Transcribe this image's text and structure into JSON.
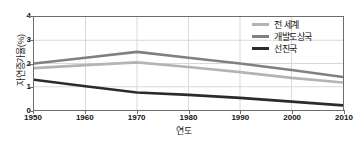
{
  "chart_data": {
    "type": "line",
    "title": "",
    "xlabel": "연도",
    "ylabel": "자연증가율(%)",
    "x": [
      1950,
      1960,
      1970,
      1980,
      1990,
      2000,
      2010
    ],
    "xlim": [
      1950,
      2010
    ],
    "ylim": [
      0,
      4
    ],
    "yticks": [
      0,
      1,
      2,
      3,
      4
    ],
    "xticks": [
      1950,
      1960,
      1970,
      1980,
      1990,
      2000,
      2010
    ],
    "grid": true,
    "legend_position": "top-right",
    "series": [
      {
        "name": "전 세계",
        "color": "#b4b4b4",
        "values": [
          1.8,
          1.93,
          2.05,
          1.85,
          1.63,
          1.38,
          1.18
        ]
      },
      {
        "name": "개발도상국",
        "color": "#808080",
        "values": [
          2.0,
          2.25,
          2.5,
          2.25,
          2.0,
          1.72,
          1.42
        ]
      },
      {
        "name": "선진국",
        "color": "#2b2b2b",
        "values": [
          1.3,
          1.02,
          0.75,
          0.65,
          0.52,
          0.36,
          0.2
        ]
      }
    ]
  },
  "axes": {
    "y_tick_labels": [
      "0",
      "1",
      "2",
      "3",
      "4"
    ],
    "x_tick_labels": [
      "1950",
      "1960",
      "1970",
      "1980",
      "1990",
      "2000",
      "2010"
    ]
  },
  "legend": {
    "items": [
      {
        "label": "전 세계"
      },
      {
        "label": "개발도상국"
      },
      {
        "label": "선진국"
      }
    ]
  },
  "colors": {
    "axis": "#6d6d6d",
    "grid": "#d9d9d9",
    "text": "#111111",
    "background": "#ffffff"
  }
}
